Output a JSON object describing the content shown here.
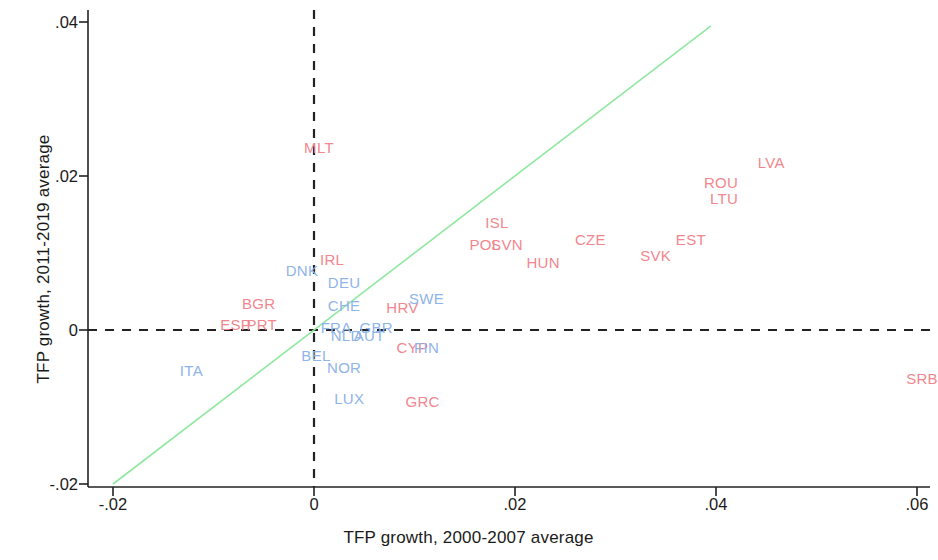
{
  "chart_data": {
    "type": "scatter",
    "title": "",
    "xlabel": "TFP growth, 2000-2007 average",
    "ylabel": "TFP growth, 2011-2019 average",
    "xlim": [
      -0.02,
      0.062
    ],
    "ylim": [
      -0.021,
      0.0425
    ],
    "xticks": [
      "-.02",
      "0",
      ".02",
      ".04",
      ".06"
    ],
    "xtick_values": [
      -0.02,
      0,
      0.02,
      0.04,
      0.06
    ],
    "yticks": [
      ".04",
      ".02",
      "0",
      "-.02"
    ],
    "ytick_values": [
      0.04,
      0.02,
      0,
      -0.02
    ],
    "grid": false,
    "legend": "none",
    "marker_style": "text-labels",
    "reference_lines": [
      {
        "name": "zero-vertical",
        "type": "vertical",
        "value": 0,
        "style": "dashed",
        "color": "#222222"
      },
      {
        "name": "zero-horizontal",
        "type": "horizontal",
        "value": 0,
        "style": "dashed",
        "color": "#222222"
      },
      {
        "name": "forty-five-degree",
        "type": "diagonal",
        "from": [
          -0.02,
          -0.02
        ],
        "to": [
          0.0395,
          0.0395
        ],
        "style": "solid",
        "color": "#8fe8a0"
      }
    ],
    "series": [
      {
        "name": "Emerging / catching-up economies",
        "color": "#f2868e",
        "points": [
          {
            "label": "MLT",
            "x": 0.0005,
            "y": 0.0238
          },
          {
            "label": "LVA",
            "x": 0.0455,
            "y": 0.0218
          },
          {
            "label": "ROU",
            "x": 0.0405,
            "y": 0.0192
          },
          {
            "label": "LTU",
            "x": 0.0408,
            "y": 0.0172
          },
          {
            "label": "ISL",
            "x": 0.0182,
            "y": 0.014
          },
          {
            "label": "CZE",
            "x": 0.0275,
            "y": 0.0118
          },
          {
            "label": "EST",
            "x": 0.0375,
            "y": 0.0118
          },
          {
            "label": "POL",
            "x": 0.017,
            "y": 0.0112
          },
          {
            "label": "SVN",
            "x": 0.0192,
            "y": 0.0112
          },
          {
            "label": "SVK",
            "x": 0.034,
            "y": 0.0098
          },
          {
            "label": "HUN",
            "x": 0.0228,
            "y": 0.0088
          },
          {
            "label": "IRL",
            "x": 0.0018,
            "y": 0.0092
          },
          {
            "label": "BGR",
            "x": -0.0055,
            "y": 0.0035
          },
          {
            "label": "HRV",
            "x": 0.0088,
            "y": 0.003
          },
          {
            "label": "ESP",
            "x": -0.0078,
            "y": 0.0008
          },
          {
            "label": "PRT",
            "x": -0.0052,
            "y": 0.0008
          },
          {
            "label": "CYP",
            "x": 0.0098,
            "y": -0.0022
          },
          {
            "label": "GRC",
            "x": 0.0108,
            "y": -0.0092
          },
          {
            "label": "SRB",
            "x": 0.0605,
            "y": -0.0062
          }
        ]
      },
      {
        "name": "Advanced Western economies",
        "color": "#8fb4e8",
        "points": [
          {
            "label": "DNK",
            "x": -0.0012,
            "y": 0.0078
          },
          {
            "label": "DEU",
            "x": 0.003,
            "y": 0.0062
          },
          {
            "label": "SWE",
            "x": 0.0112,
            "y": 0.0042
          },
          {
            "label": "CHE",
            "x": 0.003,
            "y": 0.0032
          },
          {
            "label": "FRA",
            "x": 0.0022,
            "y": 0.0004
          },
          {
            "label": "GBR",
            "x": 0.0062,
            "y": 0.0004
          },
          {
            "label": "NLD",
            "x": 0.0032,
            "y": -0.0006
          },
          {
            "label": "AUT",
            "x": 0.0055,
            "y": -0.0006
          },
          {
            "label": "FIN",
            "x": 0.0112,
            "y": -0.0022
          },
          {
            "label": "BEL",
            "x": 0.0002,
            "y": -0.0032
          },
          {
            "label": "NOR",
            "x": 0.003,
            "y": -0.0048
          },
          {
            "label": "LUX",
            "x": 0.0035,
            "y": -0.0088
          },
          {
            "label": "ITA",
            "x": -0.0122,
            "y": -0.0052
          }
        ]
      }
    ]
  }
}
